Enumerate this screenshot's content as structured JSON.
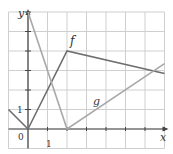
{
  "chart_data": {
    "type": "line",
    "title": "",
    "xlabel": "x",
    "ylabel": "y",
    "xlim": [
      -1,
      7
    ],
    "ylim": [
      -1,
      6
    ],
    "grid": true,
    "tick_labels": {
      "origin": "0",
      "x_one": "1",
      "y_one": "1"
    },
    "series": [
      {
        "name": "f",
        "color": "#6e6e6e",
        "points": [
          [
            -1,
            1
          ],
          [
            0,
            0
          ],
          [
            2,
            4
          ],
          [
            7,
            2.85
          ]
        ]
      },
      {
        "name": "g",
        "color": "#a8a8a8",
        "points": [
          [
            0,
            6
          ],
          [
            2,
            0
          ],
          [
            7,
            3.35
          ]
        ]
      }
    ]
  },
  "labels": {
    "f": "f",
    "g": "g",
    "x": "x",
    "y": "y",
    "zero": "0",
    "one_x": "1",
    "one_y": "1"
  }
}
